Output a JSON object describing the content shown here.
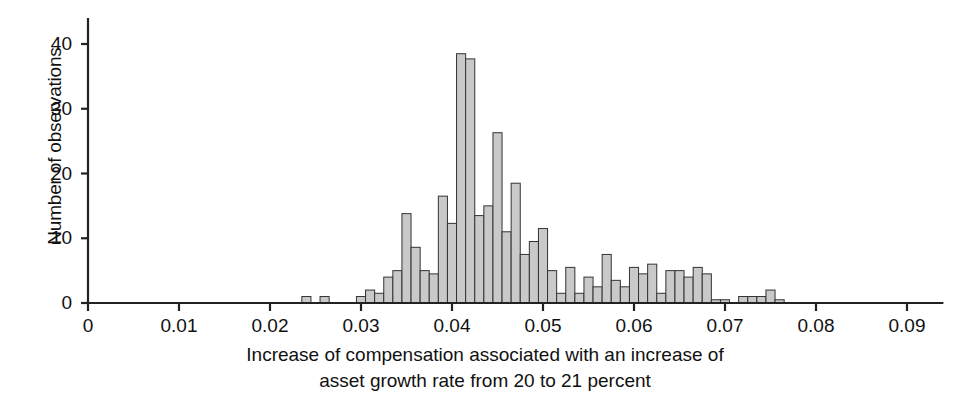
{
  "chart_data": {
    "type": "bar",
    "title": "",
    "subtitle": "",
    "xlabel": "Increase of compensation associated with an increase of asset growth rate from 20 to 21 percent",
    "xlabel_line1": "Increase of compensation associated with an increase of",
    "xlabel_line2": "asset growth rate from 20 to 21 percent",
    "ylabel": "Number of observations",
    "xlim": [
      0,
      0.094
    ],
    "ylim": [
      0,
      44
    ],
    "grid": false,
    "legend": null,
    "bin_width": 0.001,
    "bar_fill": "#c9c9c9",
    "bar_edge": "#333333",
    "axis_color": "#222222",
    "xticks": [
      0,
      0.01,
      0.02,
      0.03,
      0.04,
      0.05,
      0.06,
      0.07,
      0.08,
      0.09
    ],
    "xtick_labels": [
      "0",
      "0.01",
      "0.02",
      "0.03",
      "0.04",
      "0.05",
      "0.06",
      "0.07",
      "0.08",
      "0.09"
    ],
    "yticks": [
      0,
      10,
      20,
      30,
      40
    ],
    "ytick_labels": [
      "0",
      "10",
      "20",
      "30",
      "40"
    ],
    "x": [
      0.0235,
      0.0245,
      0.0255,
      0.0265,
      0.0275,
      0.0285,
      0.0295,
      0.0305,
      0.0315,
      0.0325,
      0.0335,
      0.0345,
      0.0355,
      0.0365,
      0.0375,
      0.0385,
      0.0395,
      0.0405,
      0.0415,
      0.0425,
      0.0435,
      0.0445,
      0.0455,
      0.0465,
      0.0475,
      0.0485,
      0.0495,
      0.0505,
      0.0515,
      0.0525,
      0.0535,
      0.0545,
      0.0555,
      0.0565,
      0.0575,
      0.0585,
      0.0595,
      0.0605,
      0.0615,
      0.0625,
      0.0635,
      0.0645,
      0.0655,
      0.0665,
      0.0675,
      0.0685,
      0.0695,
      0.0705,
      0.0715,
      0.0725,
      0.0735,
      0.0745,
      0.0755,
      0.0765,
      0.0775
    ],
    "values": [
      1,
      0,
      1,
      0,
      0,
      0,
      1,
      2,
      1.5,
      4,
      5,
      13.8,
      8.6,
      5,
      4.5,
      16.5,
      12.3,
      38.5,
      37.7,
      13.5,
      15,
      26.3,
      11,
      18.5,
      7.5,
      9.5,
      11.5,
      5,
      1.5,
      5.5,
      1.5,
      4,
      2.5,
      7.5,
      3.5,
      2.5,
      5.5,
      4.5,
      6,
      1.5,
      5,
      5,
      4,
      5.5,
      4.5,
      0.5,
      0.5,
      0,
      1,
      1,
      1,
      2,
      0.5,
      0,
      0
    ],
    "note": "Histogram of 55 bins of width 0.001 spanning roughly 0.0235 to 0.0785"
  },
  "axes": {
    "y_title": "Number of observations"
  },
  "caption": {
    "line1": "Increase of compensation associated with an increase of",
    "line2": "asset growth rate from 20 to 21 percent"
  }
}
